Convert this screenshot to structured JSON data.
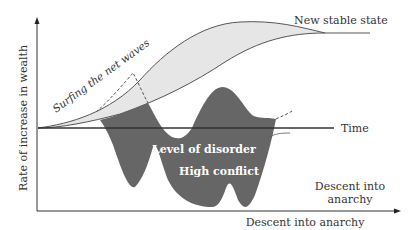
{
  "diagram": {
    "y_axis_label": "Rate of increase in wealth",
    "x_axis_label": "Descent into anarchy",
    "labels": {
      "new_stable_state": "New stable state",
      "surfing": "Surfing the net waves",
      "time": "Time",
      "level_of_disorder": "Level of disorder",
      "high_conflict": "High conflict",
      "descent_line1": "Descent into",
      "descent_line2": "anarchy"
    },
    "colors": {
      "axis": "#333333",
      "upper_band_fill": "#e6e6e6",
      "disorder_fill": "#666666",
      "curve_stroke": "#555555",
      "text": "#333333",
      "text_on_dark": "#ffffff"
    }
  }
}
